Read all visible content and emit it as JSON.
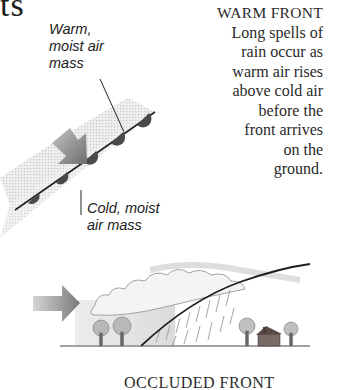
{
  "page": {
    "heading_fragment": "ts"
  },
  "warm_front_map": {
    "warm_label": [
      "Warm,",
      "moist air",
      "mass"
    ],
    "cold_label": [
      "Cold, moist",
      "air mass"
    ],
    "arrow_color": "#7a7a7a",
    "front_line_color": "#222222",
    "semicircle_color": "#4a4a4a"
  },
  "warm_front_text": {
    "title": "WARM FRONT",
    "lines": [
      "Long spells of",
      "rain occur as",
      "warm air rises",
      "above cold air",
      "before the",
      "front arrives",
      "on the",
      "ground."
    ]
  },
  "cross_section": {
    "arrow_color": "#8a8a8a",
    "ground_color": "#333333"
  },
  "next_section": {
    "title": "OCCLUDED FRONT"
  }
}
